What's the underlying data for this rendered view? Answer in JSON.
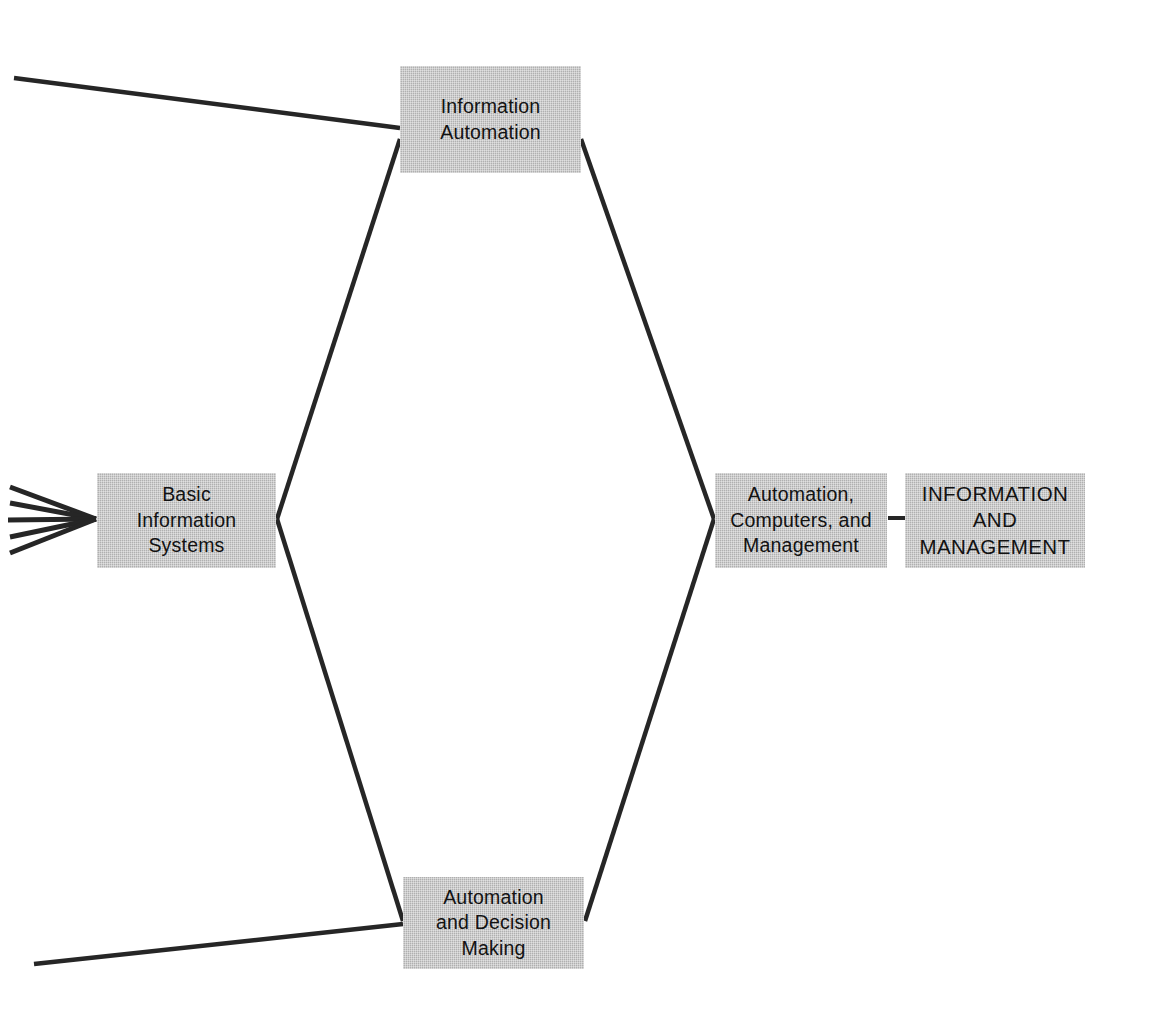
{
  "diagram": {
    "title": "Information and Management",
    "type": "concept-flow-diagram",
    "background_color": "#ffffff",
    "node_fill_color": "#b9b9b9",
    "line_color": "#262626",
    "text_color": "#121212",
    "nodes": [
      {
        "id": "information-automation",
        "label": "Information\nAutomation",
        "style": "mixed-case",
        "x": 400,
        "y": 66,
        "width": 181,
        "height": 107
      },
      {
        "id": "basic-information-systems",
        "label": "Basic\nInformation\nSystems",
        "style": "mixed-case",
        "x": 97,
        "y": 473,
        "width": 179,
        "height": 95
      },
      {
        "id": "automation-decision-making",
        "label": "Automation\nand Decision\nMaking",
        "style": "mixed-case",
        "x": 403,
        "y": 877,
        "width": 181,
        "height": 92
      },
      {
        "id": "automation-computers-management",
        "label": "Automation,\nComputers, and\nManagement",
        "style": "mixed-case",
        "x": 715,
        "y": 473,
        "width": 172,
        "height": 95
      },
      {
        "id": "information-and-management",
        "label": "INFORMATION\nAND\nMANAGEMENT",
        "style": "all-caps",
        "x": 905,
        "y": 473,
        "width": 180,
        "height": 95
      }
    ],
    "edges": [
      {
        "id": "edge-incoming-1",
        "from": "off-canvas-left",
        "to": "basic-information-systems",
        "kind": "fan-in"
      },
      {
        "id": "edge-incoming-2",
        "from": "off-canvas-left",
        "to": "basic-information-systems",
        "kind": "fan-in"
      },
      {
        "id": "edge-incoming-3",
        "from": "off-canvas-left",
        "to": "basic-information-systems",
        "kind": "fan-in"
      },
      {
        "id": "edge-incoming-4",
        "from": "off-canvas-left",
        "to": "basic-information-systems",
        "kind": "fan-in"
      },
      {
        "id": "edge-incoming-5",
        "from": "off-canvas-left",
        "to": "basic-information-systems",
        "kind": "fan-in"
      },
      {
        "id": "edge-basic-to-information-automation",
        "from": "basic-information-systems",
        "to": "information-automation",
        "kind": "diagonal"
      },
      {
        "id": "edge-basic-to-automation-decision-making",
        "from": "basic-information-systems",
        "to": "automation-decision-making",
        "kind": "diagonal"
      },
      {
        "id": "edge-information-automation-to-automation-computers",
        "from": "information-automation",
        "to": "automation-computers-management",
        "kind": "diagonal"
      },
      {
        "id": "edge-automation-decision-to-automation-computers",
        "from": "automation-decision-making",
        "to": "automation-computers-management",
        "kind": "diagonal"
      },
      {
        "id": "edge-offcanvas-top-to-information-automation",
        "from": "off-canvas-left-top",
        "to": "information-automation",
        "kind": "long-diagonal"
      },
      {
        "id": "edge-offcanvas-bottom-to-automation-decision",
        "from": "off-canvas-left-bottom",
        "to": "automation-decision-making",
        "kind": "long-diagonal"
      },
      {
        "id": "edge-automation-computers-to-information-and-management",
        "from": "automation-computers-management",
        "to": "information-and-management",
        "kind": "short-dash"
      }
    ]
  }
}
